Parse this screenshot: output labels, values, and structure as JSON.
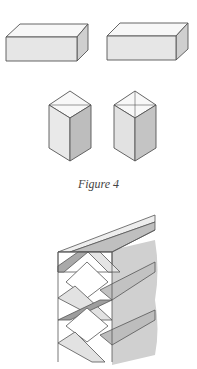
{
  "figure": {
    "caption": "Figure 4",
    "colors": {
      "line": "#555555",
      "face_light": "#f6f6f6",
      "face_mid": "#e4e4e4",
      "face_dark": "#c8c8c8",
      "band": "#b9b9b9",
      "background": "#ffffff"
    },
    "elements": [
      {
        "name": "horizontal-block-left",
        "description": "rectangular block, horizontal"
      },
      {
        "name": "horizontal-block-right",
        "description": "rectangular block, horizontal"
      },
      {
        "name": "vertical-prism-left",
        "description": "square prism standing upright"
      },
      {
        "name": "vertical-prism-right",
        "description": "square prism with diagonal top lines"
      },
      {
        "name": "stacked-lattice",
        "description": "stacked blocks with diagonal crossing bands"
      }
    ]
  }
}
